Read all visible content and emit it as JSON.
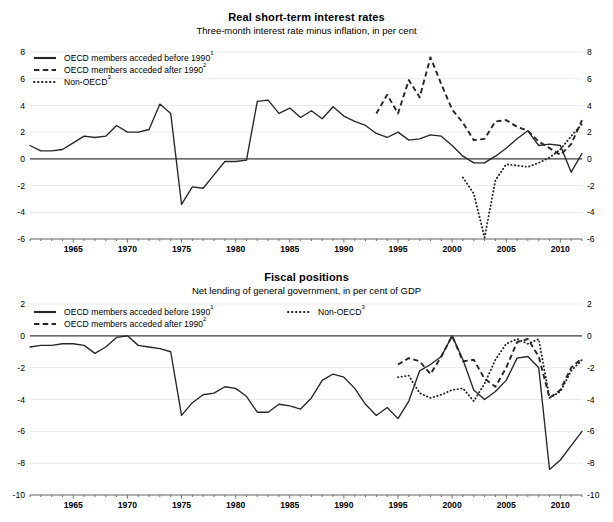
{
  "charts": [
    {
      "id": "real-short-term-interest-rates",
      "title": "Real short-term interest rates",
      "subtitle": "Three-month interest rate minus inflation, in per cent"
    },
    {
      "id": "fiscal-positions",
      "title": "Fiscal positions",
      "subtitle": "Net lending of general government, in per cent of GDP"
    }
  ],
  "legend": {
    "solid_label": "OECD members acceded before 1990",
    "solid_sup": "1",
    "dashed_label": "OECD members acceded after 1990",
    "dashed_sup": "2",
    "dotted_label": "Non-OECD",
    "dotted_sup": "3"
  },
  "chart_data": [
    {
      "type": "line",
      "title": "Real short-term interest rates",
      "subtitle": "Three-month interest rate minus inflation, in per cent",
      "xlabel": "",
      "ylabel": "",
      "xlim": [
        1961,
        2012
      ],
      "ylim": [
        -6,
        8
      ],
      "yticks": [
        -6,
        -4,
        -2,
        0,
        2,
        4,
        6,
        8
      ],
      "xticks": [
        1965,
        1970,
        1975,
        1980,
        1985,
        1990,
        1995,
        2000,
        2005,
        2010
      ],
      "xtick_minor_step": 1,
      "grid": true,
      "legend_position": "top-left",
      "series": [
        {
          "name": "OECD members acceded before 1990",
          "style": "solid",
          "x": [
            1961,
            1962,
            1963,
            1964,
            1965,
            1966,
            1967,
            1968,
            1969,
            1970,
            1971,
            1972,
            1973,
            1974,
            1975,
            1976,
            1977,
            1978,
            1979,
            1980,
            1981,
            1982,
            1983,
            1984,
            1985,
            1986,
            1987,
            1988,
            1989,
            1990,
            1991,
            1992,
            1993,
            1994,
            1995,
            1996,
            1997,
            1998,
            1999,
            2000,
            2001,
            2002,
            2003,
            2004,
            2005,
            2006,
            2007,
            2008,
            2009,
            2010,
            2011,
            2012
          ],
          "values": [
            1.0,
            0.6,
            0.6,
            0.7,
            1.2,
            1.7,
            1.6,
            1.7,
            2.5,
            2.0,
            2.0,
            2.2,
            4.1,
            3.4,
            -3.4,
            -2.1,
            -2.2,
            -1.2,
            -0.2,
            -0.2,
            -0.1,
            4.3,
            4.4,
            3.4,
            3.8,
            3.1,
            3.6,
            3.0,
            3.9,
            3.2,
            2.8,
            2.5,
            1.9,
            1.6,
            2.0,
            1.4,
            1.5,
            1.8,
            1.7,
            1.0,
            0.2,
            -0.3,
            -0.3,
            0.2,
            0.8,
            1.5,
            2.1,
            1.0,
            1.1,
            1.0,
            -1.0,
            0.4
          ]
        },
        {
          "name": "OECD members acceded after 1990",
          "style": "dashed",
          "x": [
            1993,
            1994,
            1995,
            1996,
            1997,
            1998,
            1999,
            2000,
            2001,
            2002,
            2003,
            2004,
            2005,
            2006,
            2007,
            2008,
            2009,
            2010,
            2011,
            2012
          ],
          "values": [
            3.4,
            4.8,
            3.4,
            5.9,
            4.6,
            7.6,
            5.6,
            3.7,
            2.7,
            1.4,
            1.5,
            2.8,
            2.9,
            2.4,
            2.1,
            1.3,
            0.8,
            0.3,
            1.1,
            2.9
          ]
        },
        {
          "name": "Non-OECD",
          "style": "dotted",
          "x": [
            2001,
            2002,
            2003,
            2004,
            2005,
            2006,
            2007,
            2008,
            2009,
            2010,
            2011,
            2012
          ],
          "values": [
            -1.4,
            -2.6,
            -5.9,
            -1.6,
            -0.4,
            -0.5,
            -0.6,
            -0.3,
            0.1,
            0.7,
            1.7,
            2.6
          ]
        }
      ]
    },
    {
      "type": "line",
      "title": "Fiscal positions",
      "subtitle": "Net lending of general government, in per cent of GDP",
      "xlabel": "",
      "ylabel": "",
      "xlim": [
        1961,
        2012
      ],
      "ylim": [
        -10,
        2
      ],
      "yticks": [
        -10,
        -8,
        -6,
        -4,
        -2,
        0,
        2
      ],
      "xticks": [
        1965,
        1970,
        1975,
        1980,
        1985,
        1990,
        1995,
        2000,
        2005,
        2010
      ],
      "xtick_minor_step": 1,
      "grid": true,
      "legend_position": "top-left",
      "series": [
        {
          "name": "OECD members acceded before 1990",
          "style": "solid",
          "x": [
            1961,
            1962,
            1963,
            1964,
            1965,
            1966,
            1967,
            1968,
            1969,
            1970,
            1971,
            1972,
            1973,
            1974,
            1975,
            1976,
            1977,
            1978,
            1979,
            1980,
            1981,
            1982,
            1983,
            1984,
            1985,
            1986,
            1987,
            1988,
            1989,
            1990,
            1991,
            1992,
            1993,
            1994,
            1995,
            1996,
            1997,
            1998,
            1999,
            2000,
            2001,
            2002,
            2003,
            2004,
            2005,
            2006,
            2007,
            2008,
            2009,
            2010,
            2011,
            2012
          ],
          "values": [
            -0.7,
            -0.6,
            -0.6,
            -0.5,
            -0.5,
            -0.6,
            -1.1,
            -0.7,
            -0.1,
            0.0,
            -0.6,
            -0.7,
            -0.8,
            -1.0,
            -5.0,
            -4.2,
            -3.7,
            -3.6,
            -3.2,
            -3.3,
            -3.8,
            -4.8,
            -4.8,
            -4.3,
            -4.4,
            -4.6,
            -3.9,
            -2.8,
            -2.4,
            -2.6,
            -3.3,
            -4.3,
            -5.0,
            -4.5,
            -5.2,
            -4.1,
            -2.2,
            -1.8,
            -1.3,
            0.0,
            -1.5,
            -3.4,
            -4.0,
            -3.5,
            -2.8,
            -1.4,
            -1.3,
            -2.0,
            -8.4,
            -7.8,
            -6.9,
            -6.0
          ]
        },
        {
          "name": "OECD members acceded after 1990",
          "style": "dashed",
          "x": [
            1995,
            1996,
            1997,
            1998,
            1999,
            2000,
            2001,
            2002,
            2003,
            2004,
            2005,
            2006,
            2007,
            2008,
            2009,
            2010,
            2011,
            2012
          ],
          "values": [
            -1.8,
            -1.4,
            -1.6,
            -2.4,
            -1.3,
            0.0,
            -1.6,
            -1.5,
            -2.7,
            -3.2,
            -2.0,
            -0.4,
            -0.2,
            -1.3,
            -3.9,
            -3.4,
            -2.0,
            -1.4
          ]
        },
        {
          "name": "Non-OECD",
          "style": "dotted",
          "x": [
            1995,
            1996,
            1997,
            1998,
            1999,
            2000,
            2001,
            2002,
            2003,
            2004,
            2005,
            2006,
            2007,
            2008,
            2009,
            2010,
            2011,
            2012
          ],
          "values": [
            -2.6,
            -2.5,
            -3.6,
            -3.9,
            -3.7,
            -3.4,
            -3.3,
            -4.1,
            -3.0,
            -1.5,
            -0.5,
            -0.2,
            -0.5,
            -0.2,
            -3.9,
            -3.5,
            -2.2,
            -1.5
          ]
        }
      ]
    }
  ]
}
